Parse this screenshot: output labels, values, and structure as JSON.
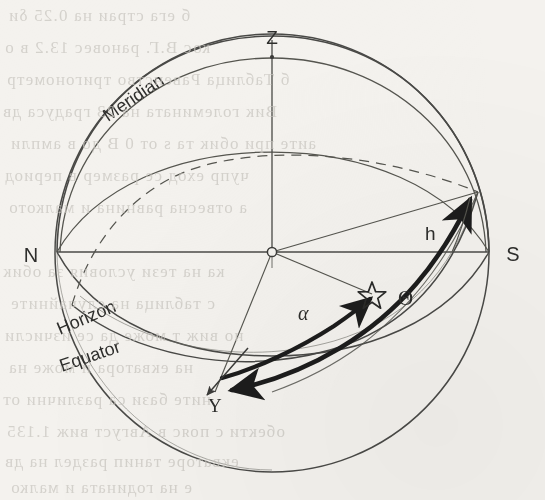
{
  "figure": {
    "media": "scanned-book-page",
    "background_color": "#f4f2ee",
    "ink_color": "#3a3a38",
    "thick_ink_color": "#1d1d1c"
  },
  "labels": {
    "zenith": "Z",
    "north": "N",
    "south": "S",
    "meridian": "Meridian",
    "horizon": "Horizon",
    "equator": "Equator",
    "hour_angle": "h",
    "right_ascension": "α",
    "sidereal_time": "Θ",
    "vernal_equinox": "Υ",
    "star": "☆"
  },
  "markers": [
    {
      "name": "zenith-point",
      "label": "Z",
      "x": 272,
      "y": 60
    },
    {
      "name": "north-point",
      "label": "N",
      "x": 57,
      "y": 252
    },
    {
      "name": "south-point",
      "label": "S",
      "x": 489,
      "y": 252
    },
    {
      "name": "observer-center",
      "label": "",
      "x": 272,
      "y": 252
    },
    {
      "name": "star-point",
      "label": "☆",
      "x": 372,
      "y": 294
    },
    {
      "name": "vernal-equinox-point",
      "label": "Υ",
      "x": 213,
      "y": 405
    }
  ],
  "great_circles": [
    {
      "name": "celestial-sphere-outline",
      "kind": "sphere-outline",
      "style": "thin-solid"
    },
    {
      "name": "meridian-circle",
      "kind": "great-circle",
      "style": "thin-solid"
    },
    {
      "name": "horizon-circle",
      "kind": "great-circle",
      "style": "thin-solid"
    },
    {
      "name": "equator-circle-front",
      "kind": "great-circle",
      "style": "thin-solid"
    },
    {
      "name": "equator-circle-back",
      "kind": "great-circle",
      "style": "thin-dashed"
    }
  ],
  "angle_arcs": [
    {
      "name": "sidereal-time-arc",
      "label": "Θ",
      "style": "thick-double-arrow"
    },
    {
      "name": "right-ascension-arc",
      "label": "α",
      "style": "thick-arrow"
    },
    {
      "name": "hour-angle-arc",
      "label": "h",
      "style": "thin"
    }
  ],
  "ghost_text": [
    "б ега страи на 0.25 δи",
    "кос В.Г. рановес 13.2 в о",
    "б Таблица Равенство тригонометр",
    "Вик големината на 23 градуса дв",
    "аите при обик та s от 0 В до в ампли",
    "чупр еход се размер в период",
    "а отвесна равнина и малкото",
    "ка на тези условия за обик",
    "с таблица на случайните",
    "но виж т може да се изчисли",
    "на екватора и може на",
    "ните бази са различни от",
    "обекти с пояс в Август виж 1.135",
    "екваторе танип раздел на дв",
    "е на годината и малко"
  ]
}
